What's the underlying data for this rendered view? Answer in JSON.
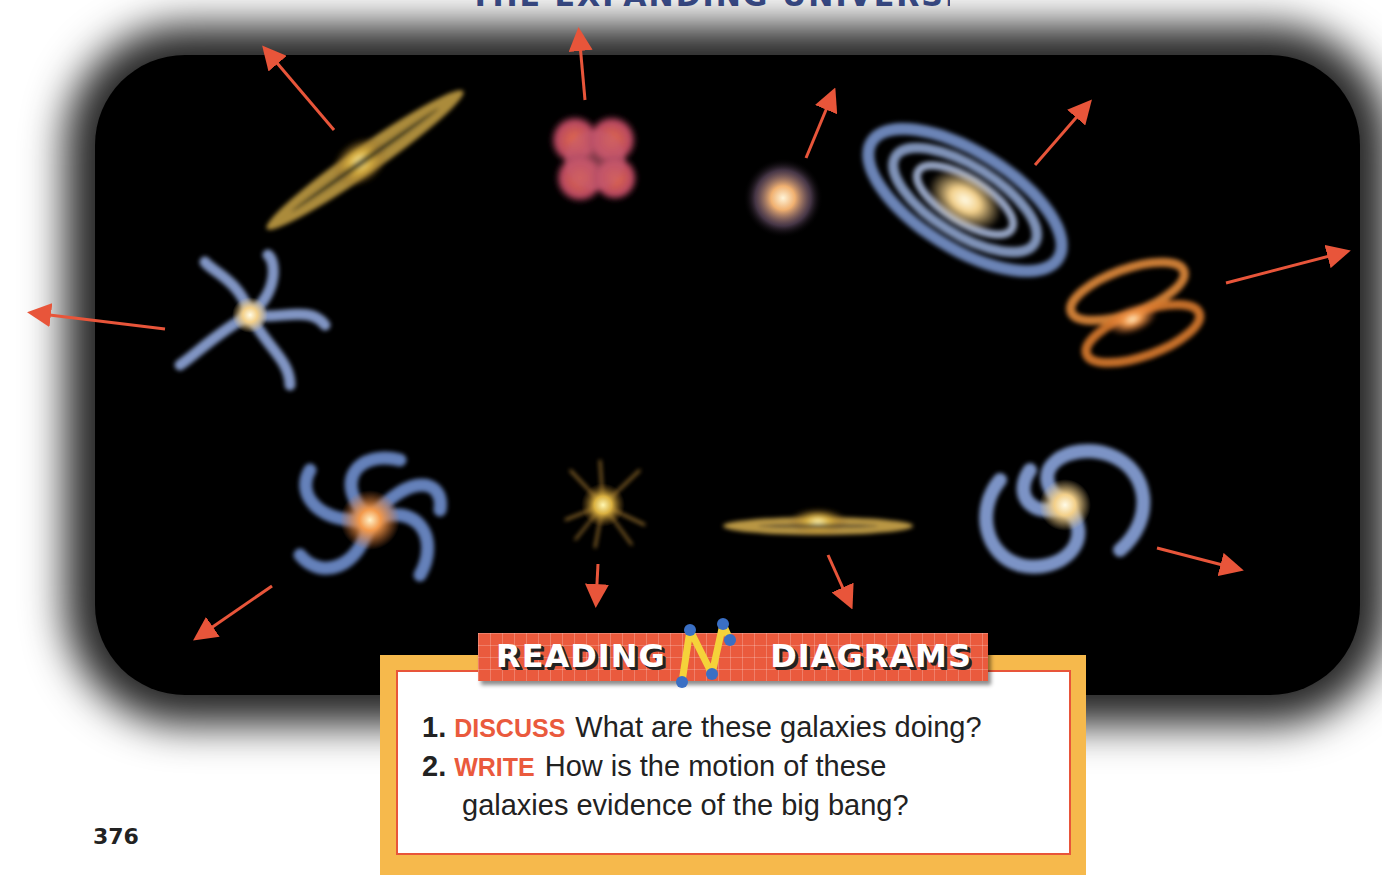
{
  "page": {
    "cut_off_title": "THE EXPANDING UNIVERSE",
    "page_number": "376"
  },
  "illustration": {
    "description": "Galaxies moving away from each other",
    "background_color": "#000000",
    "arrow_color": "#e8553a",
    "galaxies": [
      {
        "name": "edge-on-disk-galaxy",
        "color": "#d9b857"
      },
      {
        "name": "irregular-red-galaxy",
        "color": "#c9555a"
      },
      {
        "name": "elliptical-galaxy",
        "color": "#e8a869"
      },
      {
        "name": "large-spiral-galaxy",
        "color": "#7e9bd6"
      },
      {
        "name": "ringed-orange-galaxy",
        "color": "#e08a3a"
      },
      {
        "name": "pinwheel-galaxy",
        "color": "#8fa6d9"
      },
      {
        "name": "spiral-galaxy-orange-core",
        "color": "#6f8fcf"
      },
      {
        "name": "starburst-galaxy",
        "color": "#e0b04a"
      },
      {
        "name": "thin-disk-galaxy",
        "color": "#e0b357"
      },
      {
        "name": "face-on-spiral-galaxy",
        "color": "#8aa4dc"
      }
    ]
  },
  "reading_box": {
    "banner_left": "READING",
    "banner_right": "DIAGRAMS",
    "banner_color": "#ea5a3d",
    "frame_color": "#f6b94c",
    "questions": [
      {
        "number": "1.",
        "keyword": "DISCUSS",
        "text": "What are these galaxies doing?"
      },
      {
        "number": "2.",
        "keyword": "WRITE",
        "text": "How is the motion of these",
        "continuation": "galaxies evidence of the big bang?"
      }
    ]
  }
}
